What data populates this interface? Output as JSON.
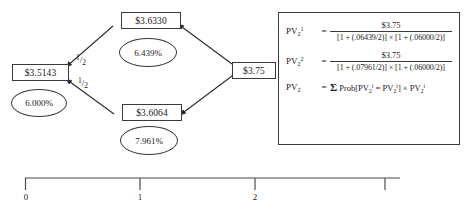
{
  "diagram": {
    "nodes": [
      {
        "id": "root",
        "label": "$3.5143",
        "rate": "6.000%"
      },
      {
        "id": "up",
        "label": "$3.6330",
        "rate": "6.439%"
      },
      {
        "id": "down",
        "label": "$3.6064",
        "rate": "7.961%"
      },
      {
        "id": "cash",
        "label": "$3.75",
        "rate": ""
      }
    ],
    "edge_labels": [
      {
        "id": "prob-up",
        "numerator": "1",
        "slash": "/",
        "denominator": "2"
      },
      {
        "id": "prob-down",
        "numerator": "1",
        "slash": "/",
        "denominator": "2"
      }
    ]
  },
  "formula": {
    "line1": {
      "lhs_base": "PV",
      "lhs_sub": "2",
      "lhs_sup": "1",
      "equals": "=",
      "numerator": "$3.75",
      "denominator": "[1 + (.06439/2)] × [1 + (.06000/2)]"
    },
    "line2": {
      "lhs_base": "PV",
      "lhs_sub": "2",
      "lhs_sup": "2",
      "equals": "=",
      "numerator": "$3.75",
      "denominator": "[1 + (.07961/2)] × [1 + (.06000/2)]"
    },
    "line3": {
      "lhs_base": "PV",
      "lhs_sub": "2",
      "equals": "=",
      "sigma": "Σ",
      "expression_pre": "Prob[PV",
      "expression_mid": " = PV",
      "expression_post": "] × PV"
    }
  },
  "timeline": {
    "ticks": [
      {
        "label": "0"
      },
      {
        "label": "1"
      },
      {
        "label": "2"
      },
      {
        "label": ""
      }
    ]
  },
  "colors": {
    "stroke": "#3a3a3a",
    "text": "#1a1a1a",
    "background": "#ffffff"
  }
}
